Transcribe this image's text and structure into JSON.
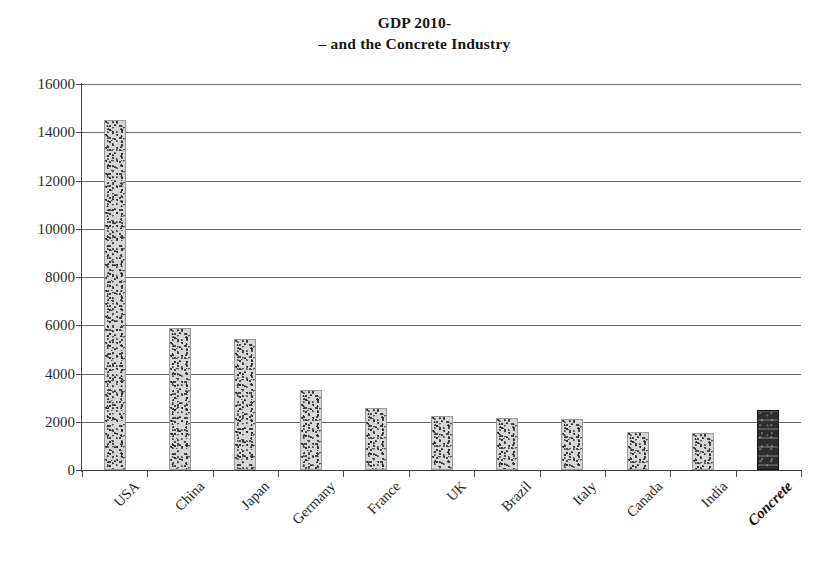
{
  "chart_data": {
    "type": "bar",
    "title": "GDP 2010- – and the Concrete Industry",
    "title_lines": [
      "GDP 2010-",
      "– and the Concrete Industry"
    ],
    "xlabel": "",
    "ylabel": "",
    "ylim": [
      0,
      16000
    ],
    "ytick_step": 2000,
    "grid": true,
    "legend": "none",
    "categories": [
      "USA",
      "China",
      "Japan",
      "Germany",
      "France",
      "UK",
      "Brazil",
      "Italy",
      "Canada",
      "India",
      "Concrete"
    ],
    "values": [
      14500,
      5880,
      5450,
      3300,
      2560,
      2250,
      2140,
      2100,
      1570,
      1550,
      2500
    ],
    "ytick_labels": [
      "16000",
      "14000",
      "12000",
      "10000",
      "8000",
      "6000",
      "4000",
      "2000",
      "0"
    ],
    "ytick_values": [
      16000,
      14000,
      12000,
      10000,
      8000,
      6000,
      4000,
      2000,
      0
    ],
    "highlight_category": "Concrete",
    "colors": {
      "bar_fill": "#d6d6d6",
      "bar_edge": "#9a9a9a",
      "highlight_fill": "#2d2d2d",
      "highlight_edge": "#111111",
      "gridline": "#6d6d6d",
      "axis": "#4a4a4a",
      "text": "#1b1b1b",
      "background": "#ffffff"
    }
  }
}
